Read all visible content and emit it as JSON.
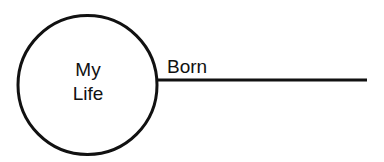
{
  "diagram": {
    "type": "timeline-origin",
    "circle": {
      "label_lines": [
        "My",
        "Life"
      ],
      "center": [
        87.5,
        85
      ],
      "radius": 70,
      "stroke": "#111111"
    },
    "timeline": {
      "label": "Born",
      "start": [
        157,
        80
      ],
      "end": [
        367,
        80
      ],
      "stroke": "#111111"
    }
  }
}
